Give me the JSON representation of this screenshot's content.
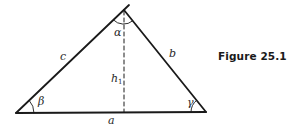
{
  "figure": {
    "caption": "Figure 25.1",
    "colors": {
      "line": "#1a1a1a",
      "text": "#2a2a2a",
      "background": "#ffffff"
    },
    "triangle": {
      "vertices": {
        "left": [
          16,
          113
        ],
        "apex": [
          124,
          10
        ],
        "right": [
          206,
          112
        ]
      },
      "sides": {
        "a": "a",
        "b": "b",
        "c": "c"
      },
      "angles": {
        "alpha": "α",
        "beta": "β",
        "gamma": "γ"
      },
      "altitude": {
        "label": "h",
        "subscript": "1",
        "style": "dashed"
      }
    }
  }
}
